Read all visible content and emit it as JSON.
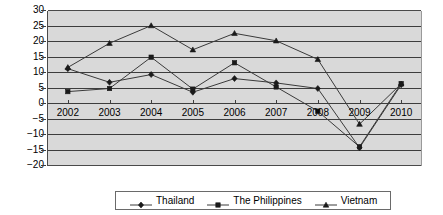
{
  "chart_data": {
    "type": "line",
    "title": "",
    "xlabel": "",
    "ylabel": "",
    "categories": [
      "2002",
      "2003",
      "2004",
      "2005",
      "2006",
      "2007",
      "2008",
      "2009",
      "2010"
    ],
    "ylim": [
      -20,
      30
    ],
    "yticks": [
      30,
      25,
      20,
      15,
      10,
      5,
      0,
      -5,
      -10,
      -15,
      -20
    ],
    "ytick_labels": [
      "30",
      "25",
      "20",
      "15",
      "10",
      "5",
      "0",
      "−5",
      "−10",
      "−15",
      "−20"
    ],
    "grid": true,
    "legend_position": "bottom",
    "plot_background": "#d9d9d9",
    "line_color": "#3a3a3a",
    "series": [
      {
        "name": "Thailand",
        "marker": "diamond",
        "values": [
          11.4,
          7.0,
          9.5,
          3.8,
          8.2,
          6.8,
          5.0,
          -14.1,
          6.2
        ]
      },
      {
        "name": "The Philippines",
        "marker": "square",
        "values": [
          4.0,
          5.0,
          15.1,
          4.8,
          13.3,
          5.5,
          -2.3,
          -13.8,
          6.6
        ]
      },
      {
        "name": "Vietnam",
        "marker": "triangle",
        "values": [
          11.8,
          19.6,
          25.3,
          17.5,
          22.8,
          20.4,
          14.4,
          -6.5,
          6.5
        ]
      }
    ]
  },
  "legend": {
    "items": [
      {
        "label": "Thailand"
      },
      {
        "label": "The Philippines"
      },
      {
        "label": "Vietnam"
      }
    ]
  }
}
